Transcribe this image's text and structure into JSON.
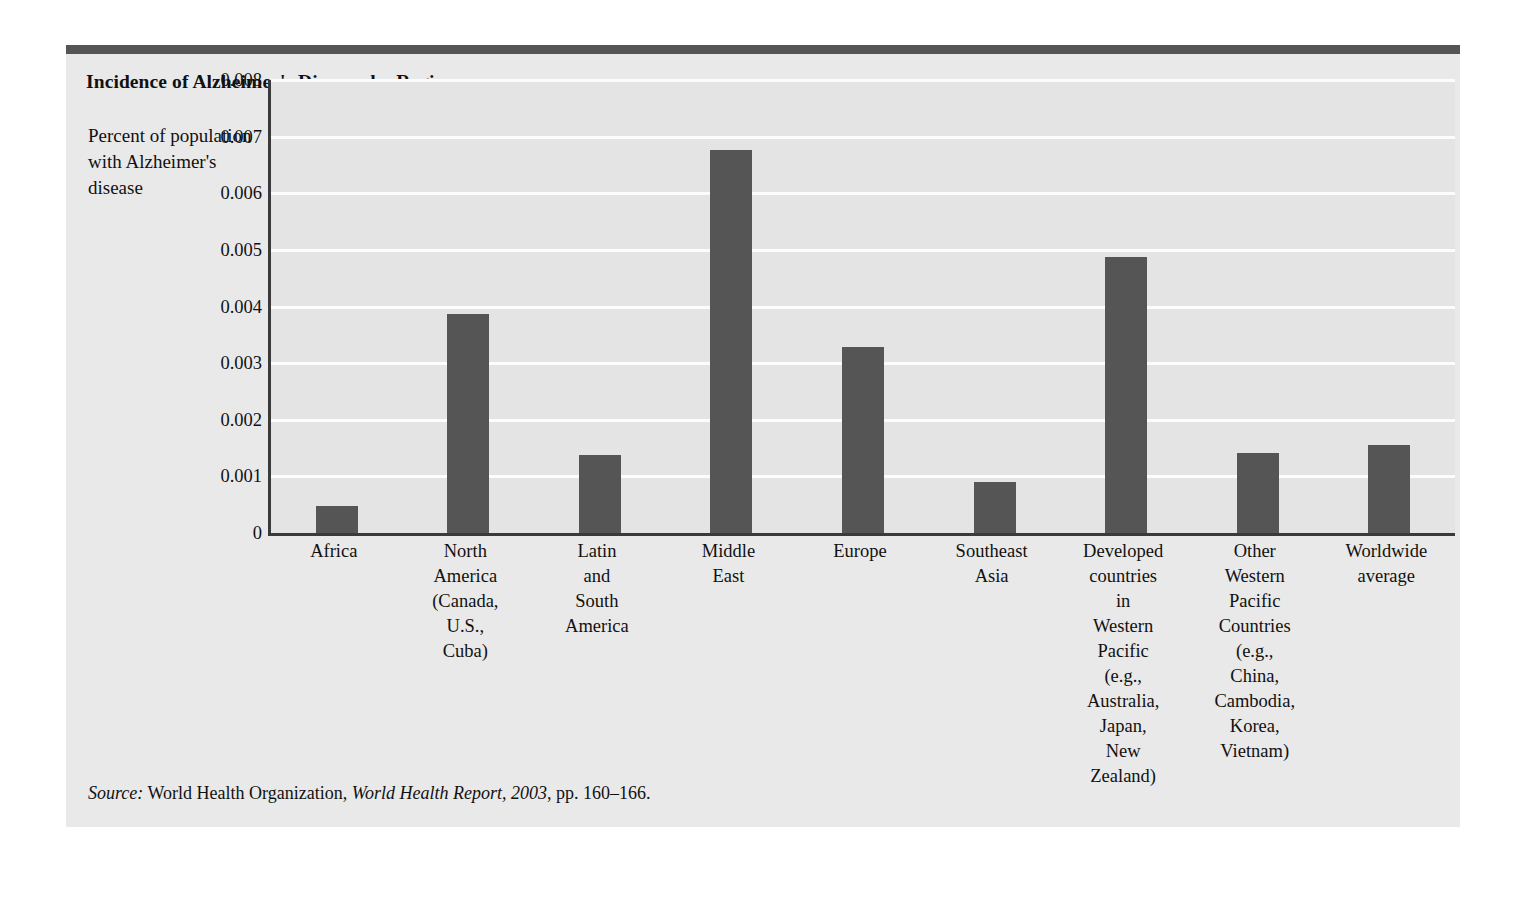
{
  "figure": {
    "title": "Incidence of Alzheimer's Disease, by Region",
    "y_caption": "Percent of population with Alzheimer's disease",
    "source": {
      "label": "Source:",
      "organization": " World Health Organization, ",
      "publication": "World Health Report, 2003",
      "pages": ", pp. 160–166."
    },
    "colors": {
      "panel_background": "#e9e9e9",
      "top_rule": "#555555",
      "plot_background": "#e4e4e4",
      "gridline": "#fcfcfc",
      "bar": "#555555",
      "axis": "#3a3a3a",
      "text": "#111111"
    }
  },
  "chart_data": {
    "type": "bar",
    "title": "Incidence of Alzheimer's Disease, by Region",
    "xlabel": "",
    "ylabel": "Percent of population with Alzheimer's disease",
    "ylim": [
      0,
      0.008
    ],
    "grid": true,
    "legend": "none",
    "ytick_labels": [
      "0.008",
      "0.007",
      "0.006",
      "0.005",
      "0.004",
      "0.003",
      "0.002",
      "0.001",
      "0"
    ],
    "ytick_values": [
      0.008,
      0.007,
      0.006,
      0.005,
      0.004,
      0.003,
      0.002,
      0.001,
      0
    ],
    "categories": [
      "Africa",
      "North America (Canada, U.S., Cuba)",
      "Latin and South America",
      "Middle East",
      "Europe",
      "Southeast Asia",
      "Developed countries in Western Pacific (e.g., Australia, Japan, New Zealand)",
      "Other Western Pacific Countries (e.g., China, Cambodia, Korea, Vietnam)",
      "Worldwide average"
    ],
    "category_lines": [
      [
        "Africa"
      ],
      [
        "North",
        "America",
        "(Canada,",
        "U.S.,",
        "Cuba)"
      ],
      [
        "Latin",
        "and",
        "South",
        "America"
      ],
      [
        "Middle",
        "East"
      ],
      [
        "Europe"
      ],
      [
        "Southeast",
        "Asia"
      ],
      [
        "Developed",
        "countries",
        "in",
        "Western",
        "Pacific",
        "(e.g.,",
        "Australia,",
        "Japan,",
        "New",
        "Zealand)"
      ],
      [
        "Other",
        "Western",
        "Pacific",
        "Countries",
        "(e.g.,",
        "China,",
        "Cambodia,",
        "Korea,",
        "Vietnam)"
      ],
      [
        "Worldwide",
        "average"
      ]
    ],
    "values": [
      0.00047,
      0.00386,
      0.00138,
      0.00676,
      0.00328,
      0.0009,
      0.00488,
      0.00142,
      0.00155
    ]
  }
}
